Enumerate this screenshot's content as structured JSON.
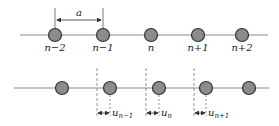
{
  "diagram": {
    "colors": {
      "line": "#8a8a8a",
      "atom_fill": "#8c8c8c",
      "atom_stroke": "#333333",
      "dash": "#777777",
      "text": "#222222"
    },
    "top_row": {
      "spacing_label": "a",
      "atoms": [
        {
          "label": "n−2"
        },
        {
          "label": "n−1"
        },
        {
          "label": "n"
        },
        {
          "label": "n+1"
        },
        {
          "label": "n+2"
        }
      ]
    },
    "bottom_row": {
      "displacements": [
        {
          "base": "u",
          "sub": "n−1"
        },
        {
          "base": "u",
          "sub": "n"
        },
        {
          "base": "u",
          "sub": "n+1"
        }
      ]
    }
  }
}
